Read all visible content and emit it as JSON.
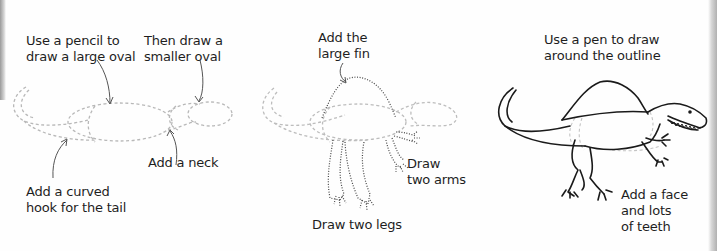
{
  "steps": {
    "step1": {
      "labels": {
        "large_oval": "Use a pencil to\ndraw a large oval",
        "small_oval": "Then draw a\nsmaller oval",
        "neck": "Add a neck",
        "tail": "Add a curved\nhook for the tail"
      }
    },
    "step2": {
      "labels": {
        "fin": "Add the\nlarge fin",
        "arms": "Draw\ntwo arms",
        "legs": "Draw two legs"
      }
    },
    "step3": {
      "labels": {
        "outline": "Use a pen to draw\naround the outline",
        "face": "Add a face\nand lots\nof teeth"
      }
    }
  },
  "colors": {
    "ink": "#1e1e1e",
    "pencil_guide": "#b5b5b5",
    "dotted": "#555555"
  }
}
